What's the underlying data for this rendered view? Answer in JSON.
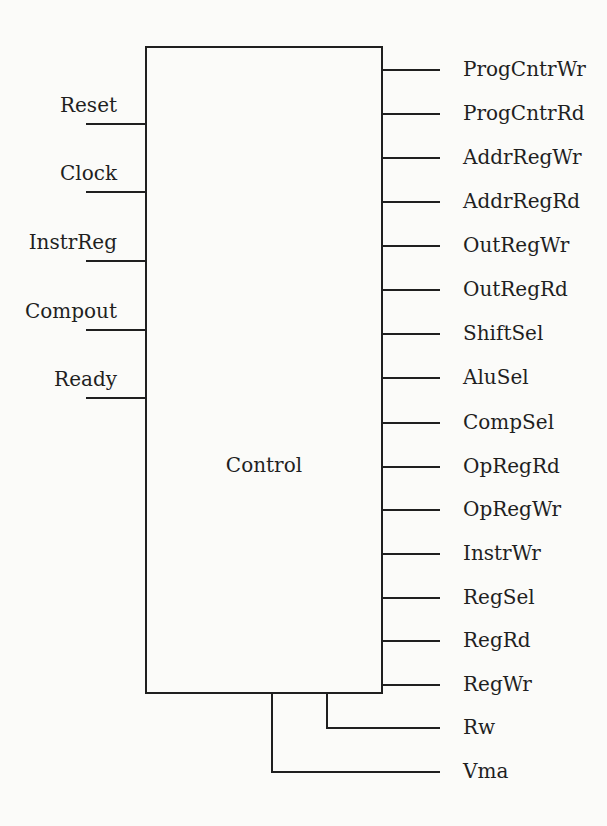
{
  "diagram": {
    "block_label": "Control",
    "inputs": [
      {
        "label": "Reset",
        "y": 124
      },
      {
        "label": "Clock",
        "y": 192
      },
      {
        "label": "InstrReg",
        "y": 261
      },
      {
        "label": "Compout",
        "y": 330
      },
      {
        "label": "Ready",
        "y": 398
      }
    ],
    "outputs": [
      {
        "label": "ProgCntrWr",
        "y": 70
      },
      {
        "label": "ProgCntrRd",
        "y": 114
      },
      {
        "label": "AddrRegWr",
        "y": 158
      },
      {
        "label": "AddrRegRd",
        "y": 202
      },
      {
        "label": "OutRegWr",
        "y": 246
      },
      {
        "label": "OutRegRd",
        "y": 290
      },
      {
        "label": "ShiftSel",
        "y": 334
      },
      {
        "label": "AluSel",
        "y": 378
      },
      {
        "label": "CompSel",
        "y": 423
      },
      {
        "label": "OpRegRd",
        "y": 467
      },
      {
        "label": "OpRegWr",
        "y": 510
      },
      {
        "label": "InstrWr",
        "y": 554
      },
      {
        "label": "RegSel",
        "y": 598
      },
      {
        "label": "RegRd",
        "y": 641
      },
      {
        "label": "RegWr",
        "y": 685
      }
    ],
    "bottom_outputs": [
      {
        "label": "Rw",
        "y": 728,
        "drop_x": 327
      },
      {
        "label": "Vma",
        "y": 772,
        "drop_x": 272
      }
    ]
  },
  "colors": {
    "ink": "#1f1f1f",
    "paper": "#fbfbf9"
  }
}
